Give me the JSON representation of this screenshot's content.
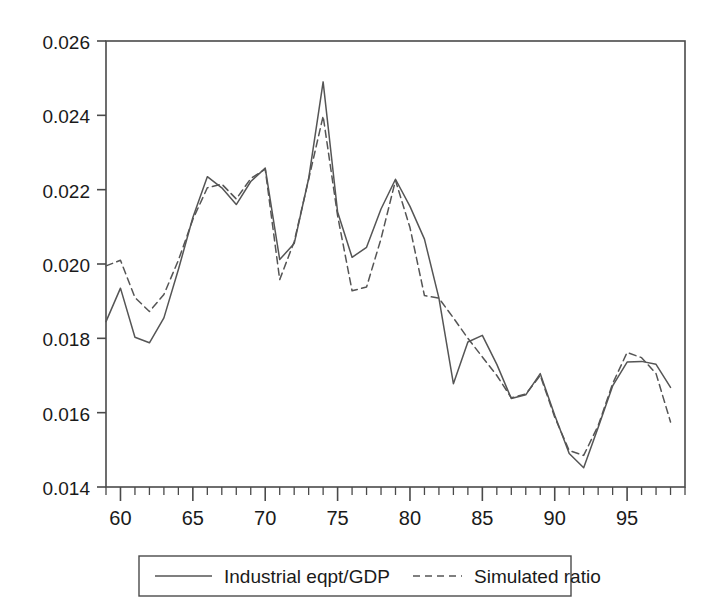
{
  "chart_data": {
    "type": "line",
    "title": "",
    "subtitle": "",
    "xlabel": "",
    "ylabel": "",
    "xlim": [
      59,
      99
    ],
    "ylim": [
      0.014,
      0.026
    ],
    "grid": false,
    "legend_position": "bottom-outside",
    "y_ticks": [
      0.014,
      0.016,
      0.018,
      0.02,
      0.022,
      0.024,
      0.026
    ],
    "y_tick_labels": [
      "0.014",
      "0.016",
      "0.018",
      "0.020",
      "0.022",
      "0.024",
      "0.026"
    ],
    "x_ticks_major": [
      60,
      65,
      70,
      75,
      80,
      85,
      90,
      95
    ],
    "x_tick_labels": [
      "60",
      "65",
      "70",
      "75",
      "80",
      "85",
      "90",
      "95"
    ],
    "x_minor_tick_step": 1,
    "x": [
      59,
      60,
      61,
      62,
      63,
      64,
      65,
      66,
      67,
      68,
      69,
      70,
      71,
      72,
      73,
      74,
      75,
      76,
      77,
      78,
      79,
      80,
      81,
      82,
      83,
      84,
      85,
      86,
      87,
      88,
      89,
      90,
      91,
      92,
      93,
      94,
      95,
      96,
      97,
      98
    ],
    "series": [
      {
        "name": "Industrial eqpt/GDP",
        "style": "solid",
        "color": "#555555",
        "values": [
          0.01845,
          0.01935,
          0.01803,
          0.01788,
          0.01855,
          0.01985,
          0.02125,
          0.02235,
          0.02205,
          0.0216,
          0.02222,
          0.02258,
          0.02012,
          0.02055,
          0.0223,
          0.0249,
          0.0214,
          0.02018,
          0.02045,
          0.02148,
          0.02228,
          0.02155,
          0.02067,
          0.01908,
          0.01678,
          0.0179,
          0.01808,
          0.0173,
          0.01638,
          0.01648,
          0.01705,
          0.01593,
          0.0149,
          0.01452,
          0.0156,
          0.01672,
          0.01736,
          0.01738,
          0.0173,
          0.01668
        ]
      },
      {
        "name": "Simulated ratio",
        "style": "dashed",
        "color": "#555555",
        "values": [
          0.01995,
          0.0201,
          0.0191,
          0.01872,
          0.01918,
          0.0201,
          0.0212,
          0.02205,
          0.02215,
          0.02175,
          0.0223,
          0.02255,
          0.01958,
          0.0206,
          0.02228,
          0.02398,
          0.0213,
          0.01928,
          0.01938,
          0.02068,
          0.02225,
          0.02098,
          0.01915,
          0.01908,
          0.01855,
          0.018,
          0.0175,
          0.017,
          0.0164,
          0.0165,
          0.017,
          0.01588,
          0.01498,
          0.01485,
          0.01565,
          0.01678,
          0.01762,
          0.01748,
          0.01705,
          0.01575
        ]
      }
    ]
  },
  "legend": {
    "entries": [
      {
        "label": "Industrial eqpt/GDP",
        "style": "solid"
      },
      {
        "label": "Simulated ratio",
        "style": "dashed"
      }
    ]
  }
}
